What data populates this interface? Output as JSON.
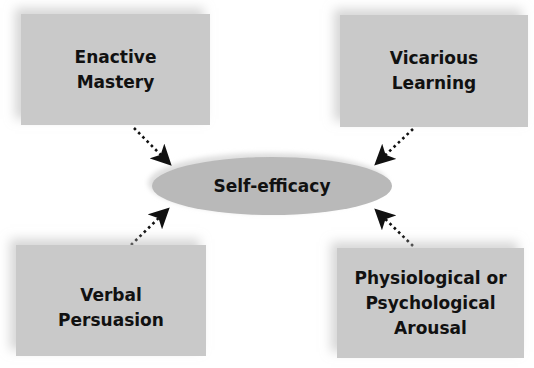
{
  "diagram": {
    "center": {
      "label": "Self-efficacy",
      "color": "#b9b9b9"
    },
    "sources": [
      {
        "id": "enactive",
        "lines": [
          "Enactive",
          "Mastery"
        ],
        "position": "top-left"
      },
      {
        "id": "vicarious",
        "lines": [
          "Vicarious",
          "Learning"
        ],
        "position": "top-right"
      },
      {
        "id": "verbal",
        "lines": [
          "Verbal",
          "Persuasion"
        ],
        "position": "bottom-left"
      },
      {
        "id": "physiological",
        "lines": [
          "Physiological or",
          "Psychological",
          "Arousal"
        ],
        "position": "bottom-right"
      }
    ],
    "box_color": "#c9c9c9",
    "arrow_style": "dotted",
    "arrow_color": "#111111"
  }
}
